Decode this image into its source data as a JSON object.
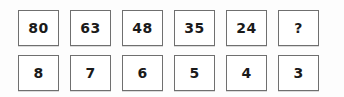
{
  "puzzle": {
    "unknown_marker": "?",
    "rows": [
      {
        "name": "top-row",
        "cells": [
          "80",
          "63",
          "48",
          "35",
          "24",
          "?"
        ]
      },
      {
        "name": "bottom-row",
        "cells": [
          "8",
          "7",
          "6",
          "5",
          "4",
          "3"
        ]
      }
    ]
  },
  "colors": {
    "background": "#fdfdfd",
    "cell_background": "#ffffff",
    "cell_border": "#6f6f6f",
    "text": "#1a1a1a"
  }
}
